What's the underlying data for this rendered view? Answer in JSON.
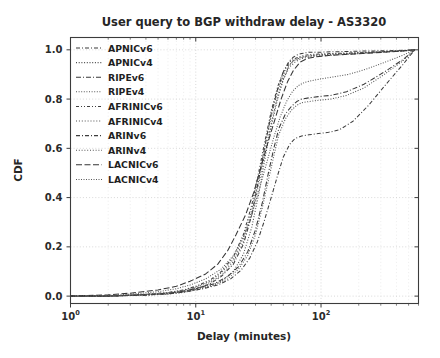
{
  "chart_data": {
    "type": "line",
    "title": "User query to BGP withdraw delay - AS3320",
    "xlabel": "Delay (minutes)",
    "ylabel": "CDF",
    "xscale": "log",
    "yscale": "linear",
    "xlim": [
      1,
      600
    ],
    "ylim": [
      -0.03,
      1.05
    ],
    "xticks": [
      1,
      10,
      100
    ],
    "xticklabels": [
      "10^0",
      "10^1",
      "10^2"
    ],
    "xtick_mantissa": "10",
    "xtick_exponents": [
      "0",
      "1",
      "2"
    ],
    "yticks": [
      0.0,
      0.2,
      0.4,
      0.6,
      0.8,
      1.0
    ],
    "yticklabels": [
      "0.0",
      "0.2",
      "0.4",
      "0.6",
      "0.8",
      "1.0"
    ],
    "grid": true,
    "grid_style": "dotted",
    "legend_position": "upper left",
    "series": [
      {
        "name": "APNICv6",
        "dash": "4,2,1,2",
        "color": "#3a3a3a",
        "x": [
          1,
          2,
          4,
          6,
          8,
          10,
          13,
          16,
          20,
          24,
          28,
          32,
          36,
          40,
          45,
          50,
          55,
          60,
          65,
          70,
          80,
          95,
          120,
          160,
          220,
          320,
          450,
          560
        ],
        "y": [
          0.0,
          0.0,
          0.005,
          0.01,
          0.02,
          0.03,
          0.05,
          0.08,
          0.13,
          0.21,
          0.33,
          0.48,
          0.62,
          0.74,
          0.84,
          0.91,
          0.95,
          0.97,
          0.98,
          0.985,
          0.99,
          0.99,
          0.992,
          0.993,
          0.995,
          0.996,
          0.998,
          1.0
        ]
      },
      {
        "name": "APNICv4",
        "dash": "1,1.7",
        "color": "#4a4a4a",
        "x": [
          1,
          2,
          4,
          6,
          8,
          10,
          13,
          16,
          20,
          24,
          28,
          32,
          36,
          40,
          45,
          50,
          55,
          60,
          70,
          80,
          95,
          120,
          160,
          220,
          320,
          450,
          560
        ],
        "y": [
          0.0,
          0.0,
          0.004,
          0.008,
          0.015,
          0.025,
          0.04,
          0.06,
          0.1,
          0.17,
          0.28,
          0.42,
          0.57,
          0.69,
          0.8,
          0.88,
          0.93,
          0.955,
          0.97,
          0.975,
          0.98,
          0.982,
          0.985,
          0.988,
          0.992,
          0.996,
          1.0
        ]
      },
      {
        "name": "RIPEv6",
        "dash": "5,2,1,2",
        "color": "#383838",
        "x": [
          1,
          2,
          4,
          6,
          8,
          10,
          14,
          18,
          22,
          26,
          30,
          34,
          38,
          42,
          46,
          52,
          58,
          64,
          70,
          80,
          95,
          120,
          160,
          220,
          320,
          450,
          560
        ],
        "y": [
          0.0,
          0.0,
          0.006,
          0.012,
          0.02,
          0.03,
          0.05,
          0.08,
          0.12,
          0.18,
          0.27,
          0.38,
          0.5,
          0.6,
          0.68,
          0.74,
          0.77,
          0.79,
          0.8,
          0.805,
          0.81,
          0.815,
          0.83,
          0.86,
          0.91,
          0.96,
          1.0
        ]
      },
      {
        "name": "RIPEv4",
        "dash": "1,1.6",
        "color": "#555555",
        "x": [
          1,
          2,
          4,
          6,
          8,
          10,
          14,
          18,
          22,
          26,
          30,
          34,
          38,
          42,
          46,
          52,
          58,
          64,
          70,
          80,
          95,
          120,
          160,
          220,
          320,
          450,
          560
        ],
        "y": [
          0.0,
          0.0,
          0.005,
          0.01,
          0.018,
          0.028,
          0.045,
          0.07,
          0.11,
          0.165,
          0.25,
          0.36,
          0.47,
          0.57,
          0.655,
          0.72,
          0.755,
          0.775,
          0.785,
          0.79,
          0.795,
          0.8,
          0.815,
          0.845,
          0.9,
          0.955,
          1.0
        ]
      },
      {
        "name": "AFRINICv6",
        "dash": "3,2,1,2,1,2",
        "color": "#404040",
        "x": [
          1,
          2,
          4,
          6,
          8,
          10,
          13,
          16,
          20,
          24,
          28,
          32,
          36,
          40,
          45,
          50,
          56,
          62,
          70,
          80,
          95,
          120,
          160,
          220,
          320,
          450,
          560
        ],
        "y": [
          0.0,
          0.0,
          0.008,
          0.015,
          0.025,
          0.04,
          0.065,
          0.1,
          0.16,
          0.25,
          0.37,
          0.51,
          0.64,
          0.75,
          0.85,
          0.91,
          0.95,
          0.965,
          0.975,
          0.98,
          0.983,
          0.985,
          0.987,
          0.99,
          0.993,
          0.996,
          1.0
        ]
      },
      {
        "name": "AFRINICv4",
        "dash": "1,1.9",
        "color": "#4f4f4f",
        "x": [
          1,
          2,
          4,
          6,
          8,
          10,
          13,
          16,
          20,
          24,
          28,
          32,
          36,
          40,
          45,
          50,
          56,
          62,
          70,
          80,
          95,
          120,
          160,
          220,
          320,
          450,
          560
        ],
        "y": [
          0.0,
          0.0,
          0.006,
          0.012,
          0.022,
          0.035,
          0.055,
          0.085,
          0.14,
          0.22,
          0.33,
          0.46,
          0.59,
          0.7,
          0.81,
          0.88,
          0.93,
          0.95,
          0.965,
          0.97,
          0.975,
          0.978,
          0.982,
          0.986,
          0.991,
          0.995,
          1.0
        ]
      },
      {
        "name": "ARINv6",
        "dash": "4,2,1,2",
        "color": "#3d3d3d",
        "x": [
          1,
          2,
          4,
          6,
          8,
          11,
          15,
          19,
          23,
          27,
          31,
          35,
          40,
          45,
          50,
          56,
          62,
          70,
          80,
          95,
          115,
          140,
          180,
          240,
          330,
          450,
          560
        ],
        "y": [
          0.0,
          0.0,
          0.004,
          0.009,
          0.016,
          0.028,
          0.045,
          0.07,
          0.105,
          0.155,
          0.22,
          0.3,
          0.4,
          0.49,
          0.565,
          0.615,
          0.64,
          0.65,
          0.655,
          0.66,
          0.665,
          0.675,
          0.71,
          0.775,
          0.86,
          0.94,
          1.0
        ]
      },
      {
        "name": "ARINv4",
        "dash": "1,1.8",
        "color": "#515151",
        "x": [
          1,
          2,
          4,
          6,
          8,
          10,
          13,
          16,
          20,
          24,
          28,
          32,
          36,
          40,
          45,
          50,
          55,
          60,
          68,
          78,
          92,
          115,
          155,
          215,
          315,
          445,
          560
        ],
        "y": [
          0.0,
          0.0,
          0.007,
          0.014,
          0.024,
          0.038,
          0.06,
          0.095,
          0.15,
          0.235,
          0.35,
          0.49,
          0.62,
          0.73,
          0.83,
          0.895,
          0.935,
          0.955,
          0.968,
          0.974,
          0.978,
          0.981,
          0.984,
          0.988,
          0.992,
          0.996,
          1.0
        ]
      },
      {
        "name": "LACNICv6",
        "dash": "6,2.5",
        "color": "#353535",
        "x": [
          1,
          2,
          3,
          5,
          7,
          9,
          12,
          15,
          18,
          21,
          25,
          29,
          33,
          38,
          43,
          48,
          54,
          60,
          68,
          78,
          92,
          115,
          155,
          215,
          315,
          445,
          560
        ],
        "y": [
          0.0,
          0.005,
          0.012,
          0.025,
          0.04,
          0.06,
          0.09,
          0.13,
          0.185,
          0.25,
          0.33,
          0.42,
          0.52,
          0.63,
          0.72,
          0.8,
          0.87,
          0.915,
          0.95,
          0.965,
          0.972,
          0.977,
          0.981,
          0.985,
          0.99,
          0.995,
          1.0
        ]
      },
      {
        "name": "LACNICv4",
        "dash": "1,1.5",
        "color": "#585858",
        "x": [
          1,
          2,
          3,
          5,
          7,
          9,
          12,
          16,
          20,
          24,
          28,
          32,
          37,
          42,
          47,
          53,
          59,
          66,
          74,
          85,
          100,
          125,
          165,
          225,
          325,
          450,
          560
        ],
        "y": [
          0.0,
          0.003,
          0.008,
          0.018,
          0.03,
          0.045,
          0.07,
          0.11,
          0.165,
          0.24,
          0.33,
          0.43,
          0.545,
          0.645,
          0.725,
          0.79,
          0.83,
          0.855,
          0.868,
          0.875,
          0.882,
          0.89,
          0.9,
          0.92,
          0.95,
          0.978,
          1.0
        ]
      }
    ]
  },
  "legend": {
    "items": [
      {
        "label": "APNICv6"
      },
      {
        "label": "APNICv4"
      },
      {
        "label": "RIPEv6"
      },
      {
        "label": "RIPEv4"
      },
      {
        "label": "AFRINICv6"
      },
      {
        "label": "AFRINICv4"
      },
      {
        "label": "ARINv6"
      },
      {
        "label": "ARINv4"
      },
      {
        "label": "LACNICv6"
      },
      {
        "label": "LACNICv4"
      }
    ]
  },
  "colors": {
    "background": "#ffffff",
    "axis": "#3c3c3c",
    "grid": "#c9c9c9",
    "text": "#262626"
  }
}
